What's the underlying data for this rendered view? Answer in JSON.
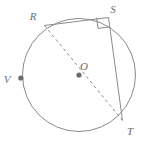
{
  "figure": {
    "type": "circle-geometry-diagram",
    "width": 149,
    "height": 143,
    "background_color": "#ffffff",
    "stroke_color": "#8a8a8a",
    "label_color": "#6e6e6e",
    "dot_color": "#6b6b6b"
  },
  "circle": {
    "name": "main-circle",
    "center_label": "O",
    "center_x": 79,
    "center_y": 75,
    "radius": 56.5,
    "stroke_width": 1
  },
  "points": [
    {
      "label": "R",
      "x": 44.5,
      "y": 25.5,
      "label_x": 36,
      "label_y": 18,
      "has_dot": false
    },
    {
      "label": "S",
      "x": 108.5,
      "y": 17.5,
      "label_x": 112,
      "label_y": 11,
      "has_dot": false
    },
    {
      "label": "T",
      "x": 122.5,
      "y": 120.5,
      "label_x": 128,
      "label_y": 133,
      "has_dot": false
    },
    {
      "label": "V",
      "x": 20.5,
      "y": 78.0,
      "label_x": 4,
      "label_y": 82,
      "has_dot": true
    },
    {
      "label": "O",
      "x": 79.0,
      "y": 75.0,
      "label_x": 80,
      "label_y": 68,
      "has_dot": true
    }
  ],
  "segments": [
    {
      "name": "chord-RS",
      "from": "R",
      "to": "S",
      "style": "solid"
    },
    {
      "name": "chord-ST",
      "from": "S",
      "to": "T",
      "style": "solid"
    },
    {
      "name": "diameter-RT",
      "from": "R",
      "to": "T",
      "style": "dashed"
    }
  ],
  "right_angle": {
    "name": "right-angle-marker-at-S",
    "at_vertex": "S",
    "size": 11,
    "x": 96,
    "y": 16
  },
  "dash_pattern": "3 3"
}
